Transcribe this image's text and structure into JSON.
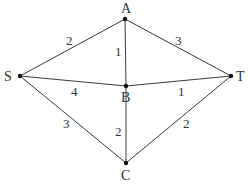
{
  "diagram": {
    "type": "weighted-undirected-graph",
    "nodes": [
      {
        "id": "A",
        "label": "A",
        "x": 125,
        "y": 19,
        "lx": 121,
        "ly": 13
      },
      {
        "id": "B",
        "label": "B",
        "x": 126,
        "y": 86,
        "lx": 121,
        "ly": 102
      },
      {
        "id": "S",
        "label": "S",
        "x": 20,
        "y": 76,
        "lx": 4,
        "ly": 81
      },
      {
        "id": "T",
        "label": "T",
        "x": 231,
        "y": 76,
        "lx": 236,
        "ly": 81
      },
      {
        "id": "C",
        "label": "C",
        "x": 126,
        "y": 163,
        "lx": 121,
        "ly": 180
      }
    ],
    "edges": [
      {
        "from": "S",
        "to": "A",
        "weight": "2",
        "wx": 66,
        "wy": 45
      },
      {
        "from": "A",
        "to": "B",
        "weight": "1",
        "wx": 115,
        "wy": 56
      },
      {
        "from": "A",
        "to": "T",
        "weight": "3",
        "wx": 175,
        "wy": 45
      },
      {
        "from": "S",
        "to": "B",
        "weight": "4",
        "wx": 71,
        "wy": 96
      },
      {
        "from": "B",
        "to": "T",
        "weight": "1",
        "wx": 178,
        "wy": 96
      },
      {
        "from": "S",
        "to": "C",
        "weight": "3",
        "wx": 63,
        "wy": 128
      },
      {
        "from": "B",
        "to": "C",
        "weight": "2",
        "wx": 115,
        "wy": 136
      },
      {
        "from": "T",
        "to": "C",
        "weight": "2",
        "wx": 183,
        "wy": 128
      }
    ]
  },
  "colors": {
    "edge": "#3a3a3a",
    "node": "#111111",
    "text": "#333333",
    "background": "#ffffff"
  }
}
